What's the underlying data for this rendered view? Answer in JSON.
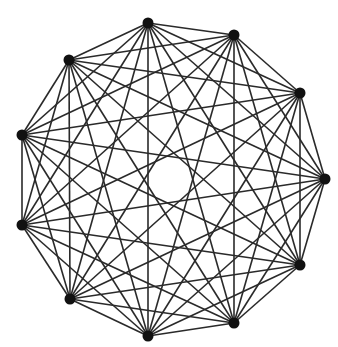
{
  "diagram": {
    "type": "complete-graph",
    "name": "K11",
    "vertex_count": 11,
    "edge_color": "#2a2a2a",
    "vertex_color": "#111111",
    "background": "#ffffff",
    "vertices": [
      {
        "id": 0,
        "x": 148,
        "y": 23
      },
      {
        "id": 1,
        "x": 234,
        "y": 35
      },
      {
        "id": 2,
        "x": 300,
        "y": 93
      },
      {
        "id": 3,
        "x": 325,
        "y": 179
      },
      {
        "id": 4,
        "x": 300,
        "y": 265
      },
      {
        "id": 5,
        "x": 234,
        "y": 323
      },
      {
        "id": 6,
        "x": 148,
        "y": 336
      },
      {
        "id": 7,
        "x": 70,
        "y": 299
      },
      {
        "id": 8,
        "x": 22,
        "y": 225
      },
      {
        "id": 9,
        "x": 22,
        "y": 135
      },
      {
        "id": 10,
        "x": 69,
        "y": 60
      }
    ]
  }
}
